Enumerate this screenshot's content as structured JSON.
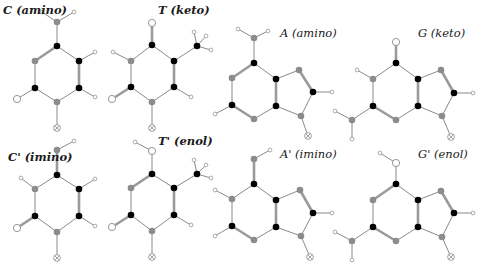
{
  "figure": {
    "legend": {
      "C": "black filled circle (carbon)",
      "N": "gray filled circle (nitrogen)",
      "O": "open circle (oxygen)",
      "H": "small open circle (hydrogen)",
      "X": "crossed circle (sugar attachment)"
    },
    "molecules": [
      {
        "id": "c-amino",
        "label": "C (amino)",
        "label_pos": [
          3,
          13
        ],
        "label_bold": true,
        "atoms": [
          [
            "N",
            57,
            22
          ],
          [
            "H",
            42,
            12
          ],
          [
            "H",
            74,
            12
          ],
          [
            "C",
            57,
            46
          ],
          [
            "N",
            35,
            61
          ],
          [
            "C",
            79,
            61
          ],
          [
            "H",
            95,
            52
          ],
          [
            "C",
            35,
            88
          ],
          [
            "O",
            17,
            99
          ],
          [
            "C",
            79,
            88
          ],
          [
            "H",
            95,
            97
          ],
          [
            "N",
            57,
            102
          ],
          [
            "X",
            57,
            128
          ]
        ],
        "bonds": [
          [
            0,
            1,
            1
          ],
          [
            0,
            2,
            1
          ],
          [
            0,
            3,
            1
          ],
          [
            3,
            4,
            2
          ],
          [
            3,
            5,
            1
          ],
          [
            5,
            6,
            1
          ],
          [
            4,
            7,
            1
          ],
          [
            7,
            8,
            1
          ],
          [
            5,
            9,
            2
          ],
          [
            9,
            10,
            1
          ],
          [
            7,
            11,
            1
          ],
          [
            9,
            11,
            1
          ],
          [
            11,
            12,
            1
          ]
        ]
      },
      {
        "id": "t-keto",
        "label": "T (keto)",
        "label_pos": [
          158,
          13
        ],
        "label_bold": true,
        "atoms": [
          [
            "O",
            152,
            23
          ],
          [
            "C",
            152,
            45
          ],
          [
            "N",
            131,
            61
          ],
          [
            "H",
            113,
            52
          ],
          [
            "C",
            174,
            61
          ],
          [
            "C",
            197,
            46
          ],
          [
            "H",
            194,
            32
          ],
          [
            "H",
            206,
            36
          ],
          [
            "H",
            211,
            50
          ],
          [
            "C",
            131,
            87
          ],
          [
            "O",
            112,
            99
          ],
          [
            "C",
            174,
            87
          ],
          [
            "H",
            191,
            97
          ],
          [
            "N",
            152,
            102
          ],
          [
            "X",
            152,
            128
          ]
        ],
        "bonds": [
          [
            0,
            1,
            2
          ],
          [
            1,
            2,
            1
          ],
          [
            1,
            4,
            1
          ],
          [
            2,
            3,
            1
          ],
          [
            4,
            5,
            1
          ],
          [
            5,
            6,
            1
          ],
          [
            5,
            7,
            1
          ],
          [
            5,
            8,
            1
          ],
          [
            2,
            9,
            1
          ],
          [
            9,
            10,
            2
          ],
          [
            4,
            11,
            2
          ],
          [
            11,
            12,
            1
          ],
          [
            9,
            13,
            1
          ],
          [
            11,
            13,
            1
          ],
          [
            13,
            14,
            1
          ]
        ]
      },
      {
        "id": "a-amino",
        "label": "A (amino)",
        "label_pos": [
          280,
          36
        ],
        "label_bold": false,
        "atoms": [
          [
            "N",
            254,
            38
          ],
          [
            "H",
            238,
            29
          ],
          [
            "H",
            268,
            31
          ],
          [
            "C",
            254,
            63
          ],
          [
            "N",
            232,
            78
          ],
          [
            "C",
            276,
            79
          ],
          [
            "N",
            299,
            70
          ],
          [
            "C",
            313,
            92
          ],
          [
            "H",
            332,
            92
          ],
          [
            "C",
            232,
            105
          ],
          [
            "H",
            215,
            114
          ],
          [
            "C",
            276,
            106
          ],
          [
            "N",
            254,
            119
          ],
          [
            "N",
            301,
            116
          ],
          [
            "X",
            308,
            136
          ]
        ],
        "bonds": [
          [
            0,
            1,
            1
          ],
          [
            0,
            2,
            1
          ],
          [
            0,
            3,
            1
          ],
          [
            3,
            4,
            2
          ],
          [
            3,
            5,
            1
          ],
          [
            5,
            6,
            1
          ],
          [
            6,
            7,
            2
          ],
          [
            7,
            8,
            1
          ],
          [
            4,
            9,
            1
          ],
          [
            9,
            10,
            1
          ],
          [
            5,
            11,
            2
          ],
          [
            9,
            12,
            2
          ],
          [
            11,
            12,
            1
          ],
          [
            11,
            13,
            1
          ],
          [
            7,
            13,
            1
          ],
          [
            13,
            14,
            1
          ]
        ]
      },
      {
        "id": "g-keto",
        "label": "G (keto)",
        "label_pos": [
          418,
          36
        ],
        "label_bold": false,
        "atoms": [
          [
            "O",
            396,
            42
          ],
          [
            "C",
            396,
            63
          ],
          [
            "N",
            373,
            79
          ],
          [
            "H",
            357,
            70
          ],
          [
            "C",
            418,
            79
          ],
          [
            "N",
            441,
            70
          ],
          [
            "C",
            454,
            93
          ],
          [
            "H",
            473,
            93
          ],
          [
            "C",
            373,
            106
          ],
          [
            "N",
            352,
            120
          ],
          [
            "H",
            335,
            111
          ],
          [
            "H",
            352,
            139
          ],
          [
            "C",
            418,
            106
          ],
          [
            "N",
            396,
            120
          ],
          [
            "N",
            442,
            116
          ],
          [
            "X",
            451,
            137
          ]
        ],
        "bonds": [
          [
            0,
            1,
            2
          ],
          [
            1,
            2,
            1
          ],
          [
            1,
            4,
            1
          ],
          [
            2,
            3,
            1
          ],
          [
            4,
            5,
            1
          ],
          [
            5,
            6,
            2
          ],
          [
            6,
            7,
            1
          ],
          [
            2,
            8,
            1
          ],
          [
            8,
            9,
            1
          ],
          [
            9,
            10,
            1
          ],
          [
            9,
            11,
            1
          ],
          [
            4,
            12,
            2
          ],
          [
            8,
            13,
            2
          ],
          [
            12,
            13,
            1
          ],
          [
            12,
            14,
            1
          ],
          [
            6,
            14,
            1
          ],
          [
            14,
            15,
            1
          ]
        ]
      },
      {
        "id": "c-imino",
        "label": "C' (imino)",
        "label_pos": [
          8,
          160
        ],
        "label_bold": true,
        "atoms": [
          [
            "N",
            57,
            150
          ],
          [
            "H",
            74,
            141
          ],
          [
            "C",
            57,
            175
          ],
          [
            "N",
            35,
            189
          ],
          [
            "H",
            21,
            178
          ],
          [
            "C",
            79,
            189
          ],
          [
            "H",
            95,
            179
          ],
          [
            "C",
            35,
            216
          ],
          [
            "O",
            17,
            228
          ],
          [
            "C",
            79,
            216
          ],
          [
            "H",
            95,
            226
          ],
          [
            "N",
            57,
            232
          ],
          [
            "X",
            57,
            258
          ]
        ],
        "bonds": [
          [
            0,
            1,
            1
          ],
          [
            0,
            2,
            2
          ],
          [
            2,
            3,
            1
          ],
          [
            3,
            4,
            1
          ],
          [
            2,
            5,
            1
          ],
          [
            5,
            6,
            1
          ],
          [
            3,
            7,
            1
          ],
          [
            7,
            8,
            2
          ],
          [
            5,
            9,
            2
          ],
          [
            9,
            10,
            1
          ],
          [
            7,
            11,
            1
          ],
          [
            9,
            11,
            1
          ],
          [
            11,
            12,
            1
          ]
        ]
      },
      {
        "id": "t-enol",
        "label": "T' (enol)",
        "label_pos": [
          158,
          144
        ],
        "label_bold": true,
        "atoms": [
          [
            "O",
            152,
            151
          ],
          [
            "H",
            135,
            142
          ],
          [
            "C",
            152,
            174
          ],
          [
            "N",
            131,
            188
          ],
          [
            "C",
            174,
            188
          ],
          [
            "C",
            197,
            174
          ],
          [
            "H",
            194,
            160
          ],
          [
            "H",
            206,
            165
          ],
          [
            "H",
            211,
            178
          ],
          [
            "C",
            131,
            215
          ],
          [
            "O",
            112,
            227
          ],
          [
            "C",
            174,
            215
          ],
          [
            "H",
            191,
            225
          ],
          [
            "N",
            152,
            231
          ],
          [
            "X",
            152,
            257
          ]
        ],
        "bonds": [
          [
            0,
            1,
            1
          ],
          [
            0,
            2,
            1
          ],
          [
            2,
            3,
            2
          ],
          [
            2,
            4,
            1
          ],
          [
            4,
            5,
            1
          ],
          [
            5,
            6,
            1
          ],
          [
            5,
            7,
            1
          ],
          [
            5,
            8,
            1
          ],
          [
            3,
            9,
            1
          ],
          [
            9,
            10,
            2
          ],
          [
            4,
            11,
            2
          ],
          [
            11,
            12,
            1
          ],
          [
            9,
            13,
            1
          ],
          [
            11,
            13,
            1
          ],
          [
            13,
            14,
            1
          ]
        ]
      },
      {
        "id": "a-imino",
        "label": "A' (imino)",
        "label_pos": [
          280,
          157
        ],
        "label_bold": false,
        "atoms": [
          [
            "N",
            254,
            159
          ],
          [
            "H",
            270,
            150
          ],
          [
            "C",
            254,
            184
          ],
          [
            "N",
            232,
            199
          ],
          [
            "H",
            215,
            190
          ],
          [
            "C",
            276,
            200
          ],
          [
            "N",
            300,
            190
          ],
          [
            "C",
            313,
            213
          ],
          [
            "H",
            332,
            213
          ],
          [
            "C",
            232,
            226
          ],
          [
            "H",
            215,
            236
          ],
          [
            "C",
            276,
            227
          ],
          [
            "N",
            254,
            240
          ],
          [
            "N",
            301,
            236
          ],
          [
            "X",
            310,
            257
          ]
        ],
        "bonds": [
          [
            0,
            1,
            1
          ],
          [
            0,
            2,
            2
          ],
          [
            2,
            3,
            1
          ],
          [
            3,
            4,
            1
          ],
          [
            2,
            5,
            1
          ],
          [
            5,
            6,
            1
          ],
          [
            6,
            7,
            2
          ],
          [
            7,
            8,
            1
          ],
          [
            3,
            9,
            1
          ],
          [
            9,
            10,
            1
          ],
          [
            5,
            11,
            2
          ],
          [
            9,
            12,
            2
          ],
          [
            11,
            12,
            1
          ],
          [
            11,
            13,
            1
          ],
          [
            7,
            13,
            1
          ],
          [
            13,
            14,
            1
          ]
        ]
      },
      {
        "id": "g-enol",
        "label": "G' (enol)",
        "label_pos": [
          418,
          157
        ],
        "label_bold": false,
        "atoms": [
          [
            "O",
            396,
            163
          ],
          [
            "H",
            380,
            153
          ],
          [
            "C",
            396,
            184
          ],
          [
            "N",
            373,
            200
          ],
          [
            "C",
            418,
            200
          ],
          [
            "N",
            441,
            191
          ],
          [
            "C",
            454,
            213
          ],
          [
            "H",
            473,
            213
          ],
          [
            "C",
            373,
            227
          ],
          [
            "N",
            352,
            241
          ],
          [
            "H",
            335,
            232
          ],
          [
            "H",
            352,
            260
          ],
          [
            "C",
            418,
            227
          ],
          [
            "N",
            396,
            241
          ],
          [
            "N",
            442,
            237
          ],
          [
            "X",
            451,
            257
          ]
        ],
        "bonds": [
          [
            0,
            1,
            1
          ],
          [
            0,
            2,
            1
          ],
          [
            2,
            3,
            2
          ],
          [
            2,
            4,
            1
          ],
          [
            4,
            5,
            1
          ],
          [
            5,
            6,
            2
          ],
          [
            6,
            7,
            1
          ],
          [
            3,
            8,
            1
          ],
          [
            8,
            9,
            1
          ],
          [
            9,
            10,
            1
          ],
          [
            9,
            11,
            1
          ],
          [
            4,
            12,
            2
          ],
          [
            8,
            13,
            2
          ],
          [
            12,
            13,
            1
          ],
          [
            12,
            14,
            1
          ],
          [
            6,
            14,
            1
          ],
          [
            14,
            15,
            1
          ]
        ]
      }
    ]
  },
  "atom_radii": {
    "C": 3.3,
    "N": 3.3,
    "O": 3.6,
    "H": 1.9,
    "X": 3.4
  }
}
